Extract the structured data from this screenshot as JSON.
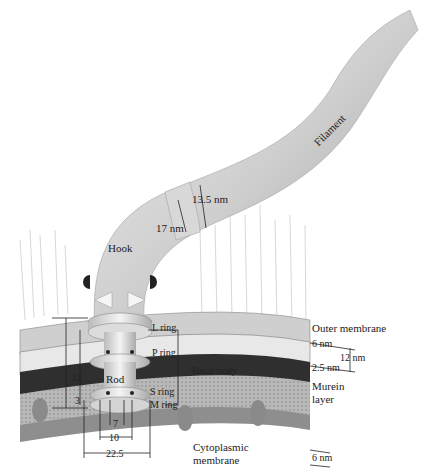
{
  "diagram": {
    "type": "Bacterial flagellum structure (gram-negative)",
    "labels": {
      "filament": "Filament",
      "hook": "Hook",
      "hook_diameter": "17 nm",
      "filament_diameter": "13.5 nm",
      "l_ring": "L ring",
      "p_ring": "P ring",
      "basal_body": "Basal body",
      "rod": "Rod",
      "s_ring": "S ring",
      "m_ring": "M ring",
      "outer_membrane": "Outer membrane",
      "outer_membrane_thickness": "6 nm",
      "periplasm_span": "12 nm",
      "murein_thickness": "2.5 nm",
      "murein_layer_line1": "Murein",
      "murein_layer_line2": "layer",
      "cytoplasmic_thickness": "6 nm",
      "cytoplasmic_membrane_line1": "Cytoplasmic",
      "cytoplasmic_membrane_line2": "membrane"
    },
    "dimensions": {
      "left_vertical": [
        "12",
        "3"
      ],
      "rod_width": "7",
      "inner_width": "10",
      "ring_width": "22.5"
    },
    "colors": {
      "background": "#ffffff",
      "filament": "#c8c8c8",
      "membrane_dark": "#3a3a3a",
      "membrane_light": "#bdbdbd",
      "ring": "#e6e6e6",
      "text": "#222222"
    }
  }
}
